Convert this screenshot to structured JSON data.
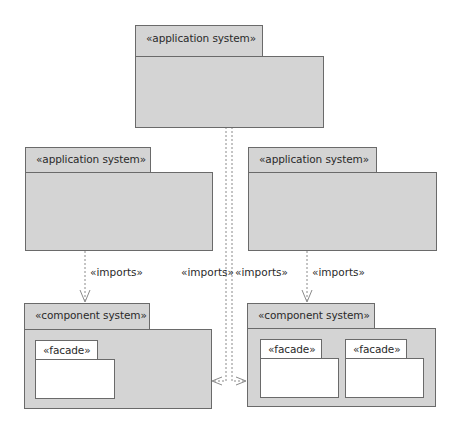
{
  "diagram": {
    "type": "UML package diagram",
    "packages": [
      {
        "id": "top",
        "stereotype": "«application system»"
      },
      {
        "id": "mid-left",
        "stereotype": "«application system»"
      },
      {
        "id": "mid-right",
        "stereotype": "«application system»"
      },
      {
        "id": "bottom-left",
        "stereotype": "«component system»",
        "children": [
          {
            "stereotype": "«facade»"
          }
        ]
      },
      {
        "id": "bottom-right",
        "stereotype": "«component system»",
        "children": [
          {
            "stereotype": "«facade»"
          },
          {
            "stereotype": "«facade»"
          }
        ]
      }
    ],
    "dependencies": [
      {
        "from": "mid-left",
        "to": "bottom-left",
        "label": "«imports»"
      },
      {
        "from": "mid-right",
        "to": "bottom-right",
        "label": "«imports»"
      },
      {
        "from": "top",
        "to": "bottom-left",
        "label": "«imports»"
      },
      {
        "from": "top",
        "to": "bottom-right",
        "label": "«imports»"
      }
    ],
    "colors": {
      "package_fill": "#d4d4d4",
      "facade_fill": "#ffffff",
      "border": "#6a6a6a",
      "dependency_line": "#8a8a8a"
    }
  }
}
